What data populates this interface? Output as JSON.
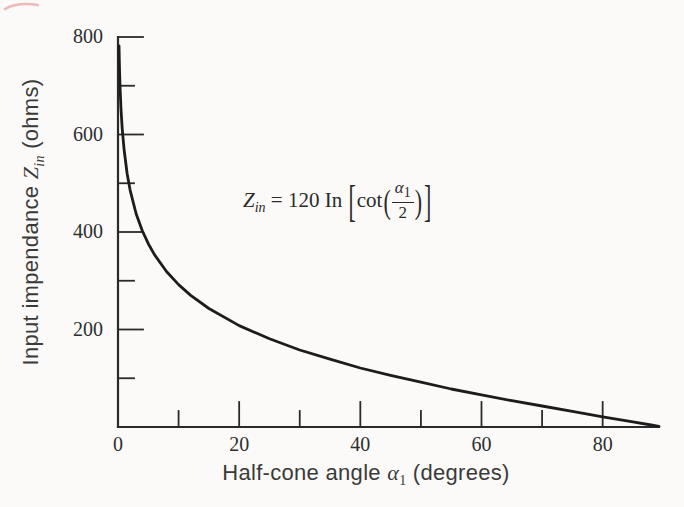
{
  "figure": {
    "background": "#fbfaf8",
    "ink": "#2a2a2a",
    "curve_color": "#1c1c1c",
    "artifact_color": "rgba(222,122,122,0.5)"
  },
  "labels": {
    "y_axis": {
      "prefix": "Input impendance ",
      "variable": "Z",
      "variable_sub": "in",
      "suffix": " (ohms)"
    },
    "x_axis": {
      "prefix": "Half-cone angle ",
      "variable": "α",
      "variable_sub": "1",
      "suffix": " (degrees)"
    }
  },
  "equation": {
    "lhs": "Z",
    "lhs_sub": "in",
    "equals_rhs": " = 120 In ",
    "lbracket": "[",
    "func": "cot",
    "lparen": "(",
    "frac_num": "α",
    "frac_num_sub": "1",
    "frac_den": "2",
    "rparen": ")",
    "rbracket": "]"
  },
  "chart_data": {
    "type": "line",
    "title": "",
    "annotation": "Zin = 120 In [cot(α1/2)]",
    "formula": "Zin = 120·ln(cot(α1/2))",
    "xlabel": "Half-cone angle α1 (degrees)",
    "ylabel": "Input impendance Zin (ohms)",
    "xlim": [
      0,
      89.3
    ],
    "ylim": [
      0,
      800
    ],
    "grid": false,
    "legend": "none",
    "x_ticks": {
      "major": [
        20,
        40,
        60,
        80
      ],
      "minor": [
        10,
        30,
        50,
        70
      ],
      "labeled": [
        0,
        20,
        40,
        60,
        80
      ]
    },
    "y_ticks": {
      "major": [
        200,
        400,
        600,
        800
      ],
      "minor": [
        100,
        300,
        500,
        700
      ],
      "labeled": [
        200,
        400,
        600,
        800
      ]
    },
    "series": [
      {
        "name": "input-impedance-vs-half-cone-angle",
        "points": [
          [
            0.17,
            782
          ],
          [
            0.25,
            735
          ],
          [
            0.35,
            695
          ],
          [
            0.5,
            652
          ],
          [
            0.7,
            612
          ],
          [
            1,
            569
          ],
          [
            1.5,
            520
          ],
          [
            2,
            486
          ],
          [
            3,
            437
          ],
          [
            4,
            403
          ],
          [
            5,
            376
          ],
          [
            6,
            354
          ],
          [
            8,
            319
          ],
          [
            10,
            292
          ],
          [
            12,
            270
          ],
          [
            15,
            243
          ],
          [
            20,
            208
          ],
          [
            25,
            181
          ],
          [
            30,
            158
          ],
          [
            35,
            139
          ],
          [
            40,
            121
          ],
          [
            45,
            106
          ],
          [
            50,
            92
          ],
          [
            55,
            78
          ],
          [
            60,
            66
          ],
          [
            65,
            54
          ],
          [
            70,
            43
          ],
          [
            75,
            32
          ],
          [
            80,
            21
          ],
          [
            85,
            10.5
          ],
          [
            88,
            4.2
          ],
          [
            89.3,
            1.5
          ]
        ]
      }
    ],
    "layout": {
      "plot": {
        "left": 118,
        "top": 37,
        "right": 659,
        "bottom": 427
      },
      "tick_len_major": 25,
      "tick_len_minor": 16,
      "axis_width": 2.2,
      "tick_width": 1.8,
      "curve_width": 2.8
    }
  }
}
